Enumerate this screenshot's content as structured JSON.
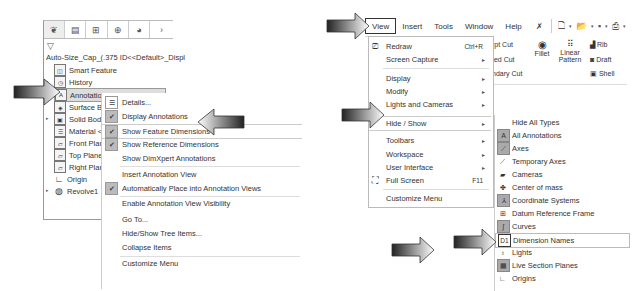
{
  "feature_manager": {
    "tabs": [
      "feature-manager",
      "property-manager",
      "configuration-manager",
      "dimxpert-manager",
      "display-manager",
      "more"
    ],
    "tab_glyphs": [
      "❦",
      "▤",
      "⊞",
      "⊕",
      "◕",
      "›"
    ],
    "filter_icon": "▽",
    "title": "Auto-Size_Cap_(.375 ID<<Default>_Displ",
    "items": [
      {
        "label": "Smart Feature",
        "icon": "◫"
      },
      {
        "label": "History",
        "icon": "◷",
        "expandable": true
      },
      {
        "label": "Annotations",
        "icon": "A",
        "selected": true
      },
      {
        "label": "Surface Bodies",
        "icon": "◈"
      },
      {
        "label": "Solid Bodies",
        "icon": "▣",
        "expandable": true
      },
      {
        "label": "Material <not specified>",
        "icon": "☰"
      },
      {
        "label": "Front Plane",
        "icon": "▱"
      },
      {
        "label": "Top Plane",
        "icon": "▱"
      },
      {
        "label": "Right Plane",
        "icon": "▱"
      },
      {
        "label": "Origin",
        "icon": "∟"
      },
      {
        "label": "Revolve1",
        "icon": "◍",
        "expandable": true
      }
    ]
  },
  "context_menu": {
    "items": [
      {
        "label": "Details...",
        "icon": "list-icon",
        "checked": false
      },
      {
        "label": "Display Annotations",
        "checked": true
      },
      {
        "label": "Show Feature Dimensions",
        "checked": true,
        "highlighted": true
      },
      {
        "label": "Show Reference Dimensions",
        "checked": true
      },
      {
        "label": "Show DimXpert Annotations",
        "checked": false
      },
      {
        "label": "Insert Annotation View",
        "checked": false
      },
      {
        "label": "Automatically Place into Annotation Views",
        "checked": true
      },
      {
        "label": "Enable Annotation View Visibility",
        "checked": false
      },
      {
        "label": "Go To...",
        "checked": false
      },
      {
        "label": "Hide/Show Tree Items...",
        "checked": false
      },
      {
        "label": "Collapse Items",
        "checked": false
      },
      {
        "label": "Customize Menu",
        "checked": false
      }
    ]
  },
  "menubar": {
    "items": [
      "View",
      "Insert",
      "Tools",
      "Window",
      "Help"
    ],
    "active": "View",
    "pin_icon": "✗"
  },
  "view_menu": {
    "items": [
      {
        "label": "Redraw",
        "shortcut": "Ctrl+R",
        "icon": "redraw-icon"
      },
      {
        "label": "Screen Capture",
        "submenu": true
      },
      {
        "label": "Display",
        "submenu": true
      },
      {
        "label": "Modify",
        "submenu": true
      },
      {
        "label": "Lights and Cameras",
        "submenu": true
      },
      {
        "label": "Hide / Show",
        "submenu": true,
        "highlighted": true
      },
      {
        "label": "Toolbars",
        "submenu": true
      },
      {
        "label": "Workspace",
        "submenu": true
      },
      {
        "label": "User Interface",
        "submenu": true
      },
      {
        "label": "Full Screen",
        "shortcut": "F11",
        "icon": "fullscreen-icon"
      },
      {
        "label": "Customize Menu"
      }
    ]
  },
  "hide_show_menu": {
    "items": [
      {
        "label": "Hide All Types",
        "icon": ""
      },
      {
        "label": "All Annotations",
        "icon": "A",
        "boxed": true
      },
      {
        "label": "Axes",
        "icon": "⟋",
        "boxed": true
      },
      {
        "label": "Temporary Axes",
        "icon": "⟋"
      },
      {
        "label": "Cameras",
        "icon": "▰"
      },
      {
        "label": "Center of mass",
        "icon": "✤"
      },
      {
        "label": "Coordinate Systems",
        "icon": "⅄",
        "boxed": true
      },
      {
        "label": "Datum Reference Frame",
        "icon": "⊞"
      },
      {
        "label": "Curves",
        "icon": "∫",
        "boxed": true
      },
      {
        "label": "Dimension Names",
        "icon": "D1",
        "highlighted": true
      },
      {
        "label": "Lights",
        "icon": "♁"
      },
      {
        "label": "Live Section Planes",
        "icon": "▦",
        "boxed": true
      },
      {
        "label": "Origins",
        "icon": "∟"
      }
    ]
  },
  "ribbon": {
    "partial_labels": [
      "rpt Cut",
      "ted Cut",
      "ndary Cut"
    ],
    "tools": [
      {
        "label": "Fillet"
      },
      {
        "label": "Linear Pattern"
      },
      {
        "label": "Rib"
      },
      {
        "label": "Draft"
      },
      {
        "label": "Shell"
      }
    ],
    "quick_access": [
      "new-document",
      "open",
      "save",
      "print",
      "undo"
    ]
  }
}
